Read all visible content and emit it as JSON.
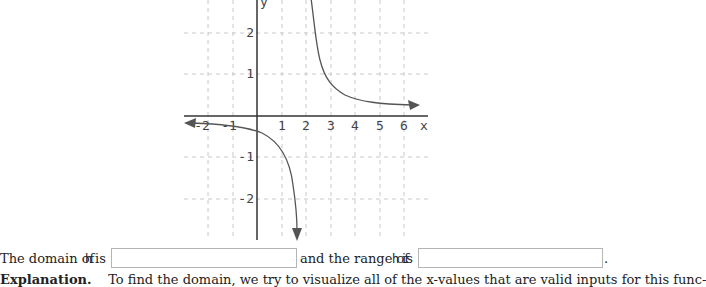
{
  "graph": {
    "x_axis_label": "x",
    "y_axis_label": "y",
    "x_ticks": [
      "-2",
      "-1",
      "1",
      "2",
      "3",
      "4",
      "5",
      "6"
    ],
    "y_ticks": [
      "2",
      "1",
      "-1",
      "-2"
    ],
    "function_name": "h",
    "vertical_asymptote": 2,
    "horizontal_asymptote": 0,
    "curve_color": "#555555",
    "grid_color": "#c8c8c8"
  },
  "question": {
    "domain_prefix": "The domain of",
    "function_symbol": "h",
    "domain_is": "is",
    "range_prefix": "and the range of",
    "range_is": "is",
    "period": ".",
    "domain_input_value": "",
    "range_input_value": ""
  },
  "explanation": {
    "heading": "Explanation",
    "text": "To find the domain, we try to visualize all of the x-values that are valid inputs for this func-"
  }
}
